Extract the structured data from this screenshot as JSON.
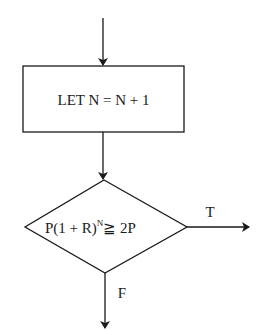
{
  "diagram": {
    "type": "flowchart",
    "colors": {
      "stroke": "#1a1a1a",
      "background": "#ffffff"
    },
    "process_box": {
      "text": "LET N = N + 1"
    },
    "decision": {
      "text_main": "P(1 + R)",
      "text_exponent": "N",
      "text_rest": "≧ 2P"
    },
    "branches": {
      "true_label": "T",
      "false_label": "F"
    }
  }
}
